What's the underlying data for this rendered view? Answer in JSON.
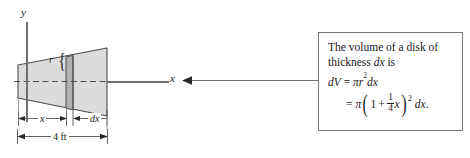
{
  "diagram": {
    "axis_y_label": "y",
    "axis_x_label": "x",
    "radius_label": "r",
    "brace_glyph": "{",
    "dimension_x_label": "x",
    "dimension_dx_label": "dx",
    "dimension_total_label": "4 ft",
    "colors": {
      "frustum_fill": "#dcdcdc",
      "slice_fill": "#b9b9b9",
      "outline": "#4d4d4d",
      "axis": "#6f6f6f",
      "box_border": "#777777",
      "text": "#1a1a1a"
    }
  },
  "callout": {
    "line1": "The volume of a disk of",
    "line2_prefix": "thickness ",
    "line2_math": "dx",
    "line2_suffix": " is",
    "formula1": {
      "lhs": "dV",
      "equals": "=",
      "pi": "π",
      "r": "r",
      "exponent": "2",
      "dx": "dx"
    },
    "formula2": {
      "equals": "=",
      "pi": "π",
      "paren_open": "(",
      "one": "1",
      "plus": "+",
      "frac_num": "1",
      "frac_den": "4",
      "var": "x",
      "paren_close": ")",
      "exponent": "2",
      "dx": "dx",
      "period": "."
    }
  }
}
